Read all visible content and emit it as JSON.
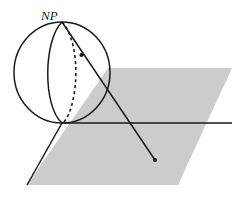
{
  "figure": {
    "kind": "stereographic-projection-diagram",
    "background_color": "#ffffff",
    "stroke_color": "#1a1a1a",
    "plane_fill_color": "#cccccc",
    "plane_edge_color": "#cccccc",
    "labels": {
      "north_pole": "NP"
    },
    "label_positions": {
      "north_pole": {
        "x": 41,
        "y": 9
      }
    },
    "sphere": {
      "center_x": 62,
      "center_y": 72.5,
      "radius_x": 48,
      "radius_y": 50.5,
      "north_pole_point": {
        "x": 62,
        "y": 22
      },
      "tangent_point": {
        "x": 62,
        "y": 123
      }
    },
    "meridian_solid": {
      "description": "front meridian bulging left",
      "path": "M62,22 C44,40 43,106 62,123"
    },
    "meridian_dashed": {
      "description": "back meridian bulging right, hidden",
      "path": "M62,22 C82,44 76,108 63,123",
      "dash_pattern": "3,3"
    },
    "horizon_line": {
      "x1": 62,
      "y1": 123,
      "x2": 232,
      "y2": 123
    },
    "plane_polygon": {
      "points": "108,68 232,68 178,185 27,185"
    },
    "projection_ray": {
      "from": {
        "x": 62,
        "y": 22
      },
      "to": {
        "x": 155,
        "y": 160
      },
      "surface_point": {
        "x": 81,
        "y": 55
      },
      "endpoint_dot": {
        "x": 155,
        "y": 160
      },
      "dot_radius": 2.1
    },
    "left_edge_line": {
      "x1": 62,
      "y1": 123,
      "x2": 27,
      "y2": 185
    }
  }
}
